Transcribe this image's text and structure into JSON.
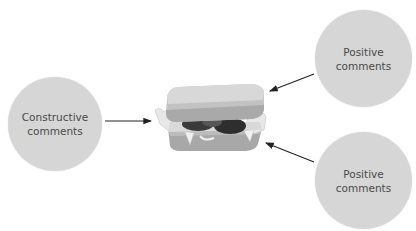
{
  "diagram": {
    "center": {
      "icon": "sandwich-icon"
    },
    "nodes": [
      {
        "id": "left",
        "line1": "Constructive",
        "line2": "comments"
      },
      {
        "id": "top-right",
        "line1": "Positive",
        "line2": "comments"
      },
      {
        "id": "bottom-right",
        "line1": "Positive",
        "line2": "comments"
      }
    ],
    "colors": {
      "circle_fill": "#d6d6d6",
      "text": "#4a4a4a",
      "arrow": "#222222",
      "bread": "#bdbdbd",
      "filling_dark": "#3a3a3a",
      "lettuce": "#e6e6e6"
    }
  }
}
